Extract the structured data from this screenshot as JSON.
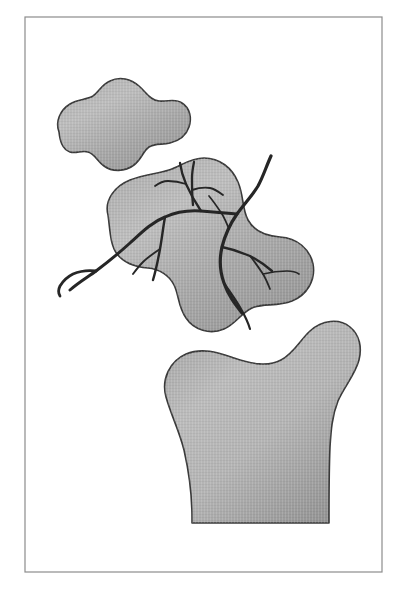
{
  "figure": {
    "type": "anatomical-line-illustration",
    "canvas": {
      "width": 407,
      "height": 594,
      "background": "#ffffff"
    },
    "frame": {
      "name": "illustration-border",
      "x": 25,
      "y": 17,
      "width": 357,
      "height": 555,
      "stroke": "#8c8c8c",
      "stroke_width": 1.2,
      "fill": "#ffffff"
    },
    "palette": {
      "bone_fill_light": "#b9b9b9",
      "bone_fill_mid": "#a3a3a3",
      "bone_fill_dark": "#8f8f8f",
      "bone_outline": "#3a3a3a",
      "vessel": "#262626",
      "background": "#ffffff",
      "frame_stroke": "#8c8c8c"
    },
    "shapes": [
      {
        "name": "upper-bone-fragment",
        "label": "Superior osteochondral fragment",
        "outline_width": 1.6,
        "path": "M 59 132 C 55 122 60 110 70 104 C 78 99 86 100 93 96 C 99 92 101 85 110 81 C 120 76 131 79 139 86 C 147 93 150 100 159 101 C 168 102 175 98 182 103 C 190 108 192 118 189 127 C 186 136 178 141 170 143 C 162 145 155 143 149 147 C 143 151 142 159 134 165 C 125 172 112 172 104 166 C 97 161 95 154 88 152 C 82 150 76 154 70 152 C 62 149 60 141 59 132 Z"
      },
      {
        "name": "middle-bone-fragment",
        "label": "Intercalary fragment with vascular supply",
        "outline_width": 1.6,
        "path": "M 108 215 C 104 200 115 186 130 180 C 145 174 157 174 169 170 C 181 166 190 158 204 158 C 220 158 232 168 238 182 C 244 196 242 209 248 220 C 254 231 266 236 280 237 C 297 238 310 249 313 264 C 316 280 307 295 292 301 C 277 307 263 303 252 308 C 241 313 236 324 224 329 C 210 335 194 330 186 318 C 178 307 179 295 174 285 C 169 275 159 269 148 268 C 135 267 124 263 117 254 C 110 245 110 229 108 215 Z"
      },
      {
        "name": "lower-bone-shaft",
        "label": "Metaphysis and diaphysis of bone",
        "outline_width": 1.6,
        "path": "M 166 397 C 161 379 170 361 186 354 C 203 347 219 353 234 358 C 252 364 268 367 281 360 C 294 353 300 340 310 331 C 322 320 339 318 350 327 C 360 335 362 348 359 360 C 355 375 344 387 338 401 C 332 416 331 431 330 447 C 329 470 329 495 329 518 L 329 523 L 192 523 L 192 518 C 192 495 189 472 184 450 C 179 430 171 415 166 397 Z"
      }
    ],
    "vessels": {
      "name": "vascular-tree",
      "label": "Nutrient artery and branches supplying the intercalary fragment",
      "color": "#262626",
      "branches": [
        {
          "name": "main-trunk",
          "width": 3.2,
          "path": "M 271 156 C 266 167 263 177 258 186 C 252 196 244 204 237 214 C 230 224 225 235 222 247 C 219 260 220 272 224 283 C 228 295 235 304 242 313"
        },
        {
          "name": "proximal-left-trunk",
          "width": 3.0,
          "path": "M 237 214 C 225 213 213 212 201 211 C 188 210 176 212 165 217 C 152 222 142 232 130 243 C 119 253 108 262 96 271 C 88 277 79 282 70 290"
        },
        {
          "name": "branch-upper-left-arch",
          "width": 2.3,
          "path": "M 201 211 C 195 202 190 193 186 184 C 183 177 181 170 180 163"
        },
        {
          "name": "branch-upper-left-spur",
          "width": 1.8,
          "path": "M 186 184 C 180 182 174 181 168 181 C 163 181 159 183 155 186"
        },
        {
          "name": "branch-mid-vertical",
          "width": 2.3,
          "path": "M 193 205 C 192 196 192 187 192 178 C 192 172 193 167 194 162"
        },
        {
          "name": "branch-mid-right-1",
          "width": 1.9,
          "path": "M 192 190 C 198 188 204 187 210 188 C 215 189 219 192 223 195"
        },
        {
          "name": "branch-mid-right-2",
          "width": 1.7,
          "path": "M 209 196 C 214 202 218 208 222 214 C 225 219 227 224 229 229"
        },
        {
          "name": "branch-descending-left",
          "width": 2.4,
          "path": "M 165 217 C 163 228 162 238 160 249 C 158 260 156 270 153 280"
        },
        {
          "name": "branch-left-lower-fork",
          "width": 1.9,
          "path": "M 160 249 C 154 253 148 257 143 262 C 139 266 136 270 133 274"
        },
        {
          "name": "branch-right-lateral",
          "width": 2.4,
          "path": "M 222 247 C 232 249 241 252 250 256 C 258 260 265 265 272 271"
        },
        {
          "name": "branch-right-lateral-tip",
          "width": 1.8,
          "path": "M 250 256 C 255 262 259 268 263 274 C 266 279 268 284 270 289"
        },
        {
          "name": "branch-right-hook",
          "width": 1.7,
          "path": "M 263 274 C 271 272 279 271 287 271 C 292 271 296 272 299 274"
        },
        {
          "name": "branch-terminal-inferior",
          "width": 2.2,
          "path": "M 224 283 C 230 292 236 300 241 309 C 245 316 248 322 250 329"
        },
        {
          "name": "distal-tail-left",
          "width": 2.8,
          "path": "M 96 271 C 88 270 80 271 73 274 C 67 277 63 281 60 286 C 58 290 58 293 60 296"
        }
      ]
    }
  }
}
